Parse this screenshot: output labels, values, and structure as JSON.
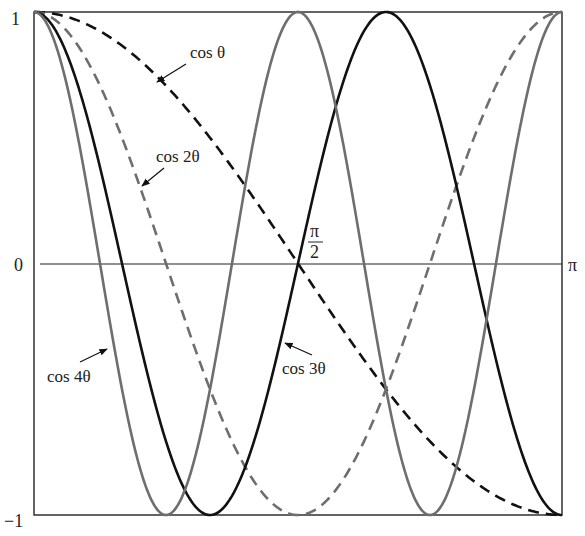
{
  "chart_data": {
    "type": "line",
    "title": "",
    "xlabel": "θ",
    "ylabel": "",
    "xlim": [
      0,
      3.14159
    ],
    "ylim": [
      -1,
      1
    ],
    "grid": false,
    "x_ticks": [
      {
        "value": 1.5708,
        "label_num": "π",
        "label_den": "2"
      },
      {
        "value": 3.14159,
        "label": "π"
      }
    ],
    "y_ticks": [
      {
        "value": 1,
        "label": "1"
      },
      {
        "value": 0,
        "label": "0"
      },
      {
        "value": -1,
        "label": "−1"
      }
    ],
    "series": [
      {
        "name": "cos θ",
        "k": 1,
        "style": "dashed",
        "color": "#111111",
        "x": [
          0,
          0.3927,
          0.7854,
          1.1781,
          1.5708,
          1.9635,
          2.3562,
          2.7489,
          3.1416
        ],
        "values": [
          1,
          0.924,
          0.707,
          0.383,
          0,
          -0.383,
          -0.707,
          -0.924,
          -1
        ]
      },
      {
        "name": "cos 2θ",
        "k": 2,
        "style": "dashed",
        "color": "#6e6e6e",
        "x": [
          0,
          0.3927,
          0.7854,
          1.1781,
          1.5708,
          1.9635,
          2.3562,
          2.7489,
          3.1416
        ],
        "values": [
          1,
          0.707,
          0,
          -0.707,
          -1,
          -0.707,
          0,
          0.707,
          1
        ]
      },
      {
        "name": "cos 3θ",
        "k": 3,
        "style": "solid",
        "color": "#111111",
        "x": [
          0,
          0.5236,
          1.0472,
          1.5708,
          2.0944,
          2.618,
          3.1416
        ],
        "values": [
          1,
          0,
          -1,
          0,
          1,
          0,
          -1
        ]
      },
      {
        "name": "cos 4θ",
        "k": 4,
        "style": "solid",
        "color": "#6e6e6e",
        "x": [
          0,
          0.3927,
          0.7854,
          1.1781,
          1.5708,
          1.9635,
          2.3562,
          2.7489,
          3.1416
        ],
        "values": [
          1,
          0,
          -1,
          0,
          1,
          0,
          -1,
          0,
          1
        ]
      }
    ],
    "annotations": [
      {
        "text": "cos θ",
        "x_px": 190,
        "y_px": 59,
        "arrow_from": [
          186,
          63
        ],
        "arrow_to": [
          155,
          83
        ]
      },
      {
        "text": "cos 2θ",
        "x_px": 155,
        "y_px": 163,
        "arrow_from": [
          163,
          170
        ],
        "arrow_to": [
          140,
          188
        ]
      },
      {
        "text": "cos 3θ",
        "x_px": 282,
        "y_px": 375,
        "arrow_from": [
          313,
          355
        ],
        "arrow_to": [
          282,
          342
        ]
      },
      {
        "text": "cos 4θ",
        "x_px": 47,
        "y_px": 382,
        "arrow_from": [
          80,
          362
        ],
        "arrow_to": [
          108,
          348
        ]
      }
    ]
  },
  "labels": {
    "y_top": "1",
    "y_zero": "0",
    "y_bottom": "−1",
    "x_right": "π",
    "x_mid_num": "π",
    "x_mid_den": "2",
    "cos1": "cos θ",
    "cos2": "cos 2θ",
    "cos3": "cos 3θ",
    "cos4": "cos 4θ"
  }
}
